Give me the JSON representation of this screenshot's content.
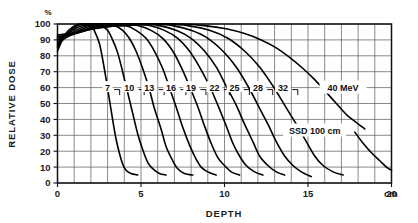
{
  "figure": {
    "background_color": "#ffffff",
    "ink_color": "#000000",
    "grid_color": "#585858"
  },
  "chart_data": {
    "type": "line",
    "title": "",
    "subtitle": "",
    "xlabel": "DEPTH",
    "ylabel": "RELATIVE DOSE",
    "y_unit_symbol": "%",
    "x_unit_label": "cm",
    "xlim": [
      0,
      20
    ],
    "ylim": [
      0,
      100
    ],
    "x_ticks_major": [
      0,
      5,
      10,
      15,
      20
    ],
    "x_tick_labels": [
      "0",
      "5",
      "10",
      "15",
      "20"
    ],
    "x_minor_step": 1,
    "y_ticks": [
      0,
      10,
      20,
      30,
      40,
      50,
      60,
      70,
      80,
      90,
      100
    ],
    "y_tick_labels": [
      "0",
      "10",
      "20",
      "30",
      "40",
      "50",
      "60",
      "70",
      "80",
      "90",
      "100"
    ],
    "grid": true,
    "legend_position": "inline-curve-labels",
    "annotations": [
      {
        "text": "SSD 100 cm",
        "x": 15.4,
        "y": 33
      },
      {
        "text": "40  MeV",
        "x": 17.1,
        "y": 60
      }
    ],
    "series": [
      {
        "name": "7",
        "label": "7 MeV",
        "energy_mev": 7,
        "label_x": 3.0,
        "label_y": 60,
        "points": [
          [
            0.0,
            83
          ],
          [
            0.2,
            88
          ],
          [
            0.5,
            94
          ],
          [
            0.9,
            98
          ],
          [
            1.3,
            100
          ],
          [
            1.7,
            100
          ],
          [
            2.0,
            99
          ],
          [
            2.2,
            96
          ],
          [
            2.5,
            88
          ],
          [
            2.7,
            78
          ],
          [
            2.9,
            66
          ],
          [
            3.1,
            53
          ],
          [
            3.3,
            40
          ],
          [
            3.5,
            28
          ],
          [
            3.7,
            19
          ],
          [
            3.9,
            12
          ],
          [
            4.1,
            8
          ],
          [
            4.4,
            6
          ],
          [
            4.8,
            5
          ]
        ]
      },
      {
        "name": "10",
        "label": "10 MeV",
        "energy_mev": 10,
        "label_x": 4.3,
        "label_y": 60,
        "points": [
          [
            0.0,
            85
          ],
          [
            0.3,
            90
          ],
          [
            0.7,
            95
          ],
          [
            1.2,
            99
          ],
          [
            1.7,
            100
          ],
          [
            2.2,
            100
          ],
          [
            2.6,
            99
          ],
          [
            3.0,
            96
          ],
          [
            3.3,
            90
          ],
          [
            3.6,
            82
          ],
          [
            3.9,
            70
          ],
          [
            4.2,
            57
          ],
          [
            4.5,
            44
          ],
          [
            4.8,
            31
          ],
          [
            5.1,
            21
          ],
          [
            5.4,
            13
          ],
          [
            5.7,
            9
          ],
          [
            6.1,
            6
          ],
          [
            6.5,
            5
          ]
        ]
      },
      {
        "name": "13",
        "label": "13 MeV",
        "energy_mev": 13,
        "label_x": 5.5,
        "label_y": 60,
        "points": [
          [
            0.0,
            86
          ],
          [
            0.4,
            91
          ],
          [
            0.9,
            96
          ],
          [
            1.5,
            99
          ],
          [
            2.1,
            100
          ],
          [
            2.8,
            100
          ],
          [
            3.4,
            99
          ],
          [
            3.9,
            96
          ],
          [
            4.3,
            91
          ],
          [
            4.7,
            83
          ],
          [
            5.1,
            72
          ],
          [
            5.5,
            59
          ],
          [
            5.8,
            47
          ],
          [
            6.2,
            34
          ],
          [
            6.5,
            23
          ],
          [
            6.9,
            14
          ],
          [
            7.2,
            9
          ],
          [
            7.6,
            6
          ],
          [
            8.1,
            5
          ]
        ]
      },
      {
        "name": "16",
        "label": "16 MeV",
        "energy_mev": 16,
        "label_x": 6.8,
        "label_y": 60,
        "points": [
          [
            0.0,
            87
          ],
          [
            0.5,
            92
          ],
          [
            1.1,
            96
          ],
          [
            1.8,
            99
          ],
          [
            2.5,
            100
          ],
          [
            3.3,
            100
          ],
          [
            4.1,
            99
          ],
          [
            4.7,
            96
          ],
          [
            5.3,
            91
          ],
          [
            5.8,
            83
          ],
          [
            6.3,
            72
          ],
          [
            6.7,
            60
          ],
          [
            7.1,
            48
          ],
          [
            7.5,
            35
          ],
          [
            7.9,
            24
          ],
          [
            8.3,
            15
          ],
          [
            8.6,
            10
          ],
          [
            9.0,
            7
          ],
          [
            9.5,
            5
          ]
        ]
      },
      {
        "name": "19",
        "label": "19 MeV",
        "energy_mev": 19,
        "label_x": 8.0,
        "label_y": 60,
        "points": [
          [
            0.0,
            88
          ],
          [
            0.6,
            92
          ],
          [
            1.3,
            96
          ],
          [
            2.1,
            99
          ],
          [
            3.0,
            100
          ],
          [
            3.9,
            100
          ],
          [
            4.8,
            99
          ],
          [
            5.6,
            96
          ],
          [
            6.3,
            91
          ],
          [
            6.9,
            83
          ],
          [
            7.4,
            73
          ],
          [
            7.9,
            61
          ],
          [
            8.4,
            48
          ],
          [
            8.8,
            36
          ],
          [
            9.2,
            25
          ],
          [
            9.6,
            16
          ],
          [
            10.0,
            11
          ],
          [
            10.4,
            7
          ],
          [
            10.9,
            5
          ]
        ]
      },
      {
        "name": "22",
        "label": "22 MeV",
        "energy_mev": 22,
        "label_x": 9.4,
        "label_y": 60,
        "points": [
          [
            0.0,
            89
          ],
          [
            0.7,
            93
          ],
          [
            1.5,
            96
          ],
          [
            2.4,
            99
          ],
          [
            3.4,
            100
          ],
          [
            4.5,
            100
          ],
          [
            5.5,
            99
          ],
          [
            6.4,
            96
          ],
          [
            7.2,
            91
          ],
          [
            7.9,
            83
          ],
          [
            8.5,
            73
          ],
          [
            9.1,
            61
          ],
          [
            9.6,
            49
          ],
          [
            10.1,
            36
          ],
          [
            10.5,
            25
          ],
          [
            10.9,
            17
          ],
          [
            11.3,
            11
          ],
          [
            11.8,
            7
          ],
          [
            12.3,
            5
          ]
        ]
      },
      {
        "name": "25",
        "label": "25 MeV",
        "energy_mev": 25,
        "label_x": 10.6,
        "label_y": 60,
        "points": [
          [
            0.0,
            90
          ],
          [
            0.8,
            93
          ],
          [
            1.7,
            96
          ],
          [
            2.7,
            99
          ],
          [
            3.8,
            100
          ],
          [
            5.0,
            100
          ],
          [
            6.1,
            99
          ],
          [
            7.1,
            96
          ],
          [
            8.0,
            91
          ],
          [
            8.8,
            83
          ],
          [
            9.5,
            73
          ],
          [
            10.1,
            61
          ],
          [
            10.7,
            49
          ],
          [
            11.2,
            37
          ],
          [
            11.7,
            26
          ],
          [
            12.1,
            17
          ],
          [
            12.6,
            11
          ],
          [
            13.1,
            7
          ],
          [
            13.6,
            5
          ]
        ]
      },
      {
        "name": "28",
        "label": "28 MeV",
        "energy_mev": 28,
        "label_x": 12.0,
        "label_y": 60,
        "points": [
          [
            0.0,
            91
          ],
          [
            0.9,
            94
          ],
          [
            1.9,
            97
          ],
          [
            3.0,
            99
          ],
          [
            4.3,
            100
          ],
          [
            5.6,
            100
          ],
          [
            6.9,
            99
          ],
          [
            8.0,
            96
          ],
          [
            9.0,
            91
          ],
          [
            9.9,
            83
          ],
          [
            10.7,
            73
          ],
          [
            11.4,
            61
          ],
          [
            12.0,
            49
          ],
          [
            12.6,
            37
          ],
          [
            13.1,
            26
          ],
          [
            13.6,
            17
          ],
          [
            14.1,
            11
          ],
          [
            14.6,
            7
          ],
          [
            15.2,
            4
          ]
        ]
      },
      {
        "name": "32",
        "label": "32 MeV",
        "energy_mev": 32,
        "label_x": 13.5,
        "label_y": 60,
        "points": [
          [
            0.0,
            92
          ],
          [
            1.0,
            94
          ],
          [
            2.2,
            97
          ],
          [
            3.5,
            99
          ],
          [
            4.9,
            100
          ],
          [
            6.4,
            100
          ],
          [
            7.8,
            99
          ],
          [
            9.1,
            96
          ],
          [
            10.2,
            91
          ],
          [
            11.2,
            83
          ],
          [
            12.1,
            73
          ],
          [
            12.9,
            61
          ],
          [
            13.6,
            49
          ],
          [
            14.3,
            37
          ],
          [
            14.9,
            26
          ],
          [
            15.4,
            17
          ],
          [
            15.9,
            11
          ],
          [
            16.5,
            7
          ],
          [
            17.1,
            5
          ]
        ]
      },
      {
        "name": "40",
        "label": "40 MeV",
        "energy_mev": 40,
        "label_x": 17.1,
        "label_y": 60,
        "points": [
          [
            0.0,
            93
          ],
          [
            1.2,
            95
          ],
          [
            2.6,
            98
          ],
          [
            4.2,
            99
          ],
          [
            5.8,
            100
          ],
          [
            7.4,
            100
          ],
          [
            8.8,
            99
          ],
          [
            10.1,
            97
          ],
          [
            11.2,
            94
          ],
          [
            12.2,
            90
          ],
          [
            13.1,
            85
          ],
          [
            13.9,
            79
          ],
          [
            14.7,
            72
          ],
          [
            15.4,
            65
          ],
          [
            16.1,
            57
          ],
          [
            16.7,
            50
          ],
          [
            17.3,
            43
          ],
          [
            17.9,
            38
          ],
          [
            18.4,
            34
          ]
        ]
      },
      {
        "name": "40-bremsstrahlung-tail",
        "label": "40 MeV bremsstrahlung tail",
        "energy_mev": 40,
        "label_x": null,
        "label_y": null,
        "points": [
          [
            17.8,
            32
          ],
          [
            18.3,
            25
          ],
          [
            18.8,
            19
          ],
          [
            19.3,
            14
          ],
          [
            19.7,
            10
          ],
          [
            20.0,
            8
          ]
        ]
      }
    ]
  }
}
